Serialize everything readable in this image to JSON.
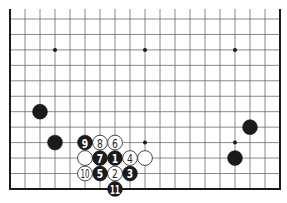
{
  "diagram": {
    "type": "go-board-partial",
    "board": {
      "columns": 19,
      "rows_visible": 12,
      "bottom_edge_visible": true,
      "left_edge_visible": true,
      "right_edge_visible": true,
      "top_edge_visible": false
    },
    "colors": {
      "background": "#ffffff",
      "grid": "#6a6a6a",
      "edge": "#1a1a1a",
      "black_stone": "#1b1b1b",
      "white_stone": "#ffffff"
    },
    "star_points": [
      {
        "col": 3,
        "row": 2
      },
      {
        "col": 9,
        "row": 2
      },
      {
        "col": 15,
        "row": 2
      },
      {
        "col": 9,
        "row": 8
      },
      {
        "col": 15,
        "row": 8
      }
    ],
    "stones": [
      {
        "color": "black",
        "col": 2,
        "row": 6,
        "label": ""
      },
      {
        "color": "black",
        "col": 3,
        "row": 8,
        "label": ""
      },
      {
        "color": "black",
        "col": 16,
        "row": 7,
        "label": ""
      },
      {
        "color": "black",
        "col": 15,
        "row": 9,
        "label": ""
      },
      {
        "color": "white",
        "col": 5,
        "row": 9,
        "label": ""
      },
      {
        "color": "white",
        "col": 9,
        "row": 9,
        "label": ""
      },
      {
        "color": "black",
        "col": 7,
        "row": 9,
        "label": "1"
      },
      {
        "color": "white",
        "col": 7,
        "row": 10,
        "label": "2"
      },
      {
        "color": "black",
        "col": 8,
        "row": 10,
        "label": "3"
      },
      {
        "color": "white",
        "col": 8,
        "row": 9,
        "label": "4"
      },
      {
        "color": "black",
        "col": 6,
        "row": 10,
        "label": "5"
      },
      {
        "color": "white",
        "col": 7,
        "row": 8,
        "label": "6"
      },
      {
        "color": "black",
        "col": 6,
        "row": 9,
        "label": "7"
      },
      {
        "color": "white",
        "col": 6,
        "row": 8,
        "label": "8"
      },
      {
        "color": "black",
        "col": 5,
        "row": 8,
        "label": "9"
      },
      {
        "color": "white",
        "col": 5,
        "row": 10,
        "label": "10"
      },
      {
        "color": "black",
        "col": 7,
        "row": 11,
        "label": "11"
      }
    ]
  }
}
